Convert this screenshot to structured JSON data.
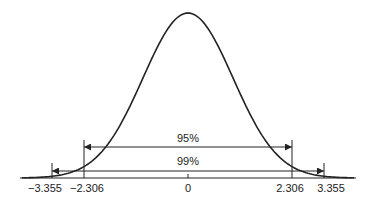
{
  "chart_data": {
    "type": "line",
    "title": "",
    "xlabel": "",
    "ylabel": "",
    "x_ticks": [
      "-3.355",
      "-2.306",
      "0",
      "2.306",
      "3.355"
    ],
    "intervals": [
      {
        "label": "95%",
        "lower": -2.306,
        "upper": 2.306
      },
      {
        "label": "99%",
        "lower": -3.355,
        "upper": 3.355
      }
    ],
    "grid": false,
    "legend": null,
    "colors": {
      "line": "#222222",
      "background": "#ffffff"
    }
  },
  "labels": {
    "tick_neg_3355": "−3.355",
    "tick_neg_2306": "−2.306",
    "tick_zero": "0",
    "tick_pos_2306": "2.306",
    "tick_pos_3355": "3.355",
    "interval_95": "95%",
    "interval_99": "99%"
  }
}
